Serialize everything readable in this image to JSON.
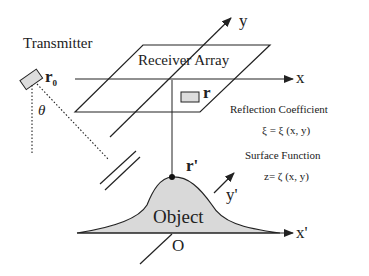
{
  "diagram": {
    "labels": {
      "transmitter": "Transmitter",
      "transmitter_position": "r",
      "transmitter_position_subscript": "0",
      "angle": "θ",
      "receiver_array": "Receiver  Array",
      "receiver_position": "r",
      "axis_x": "x",
      "axis_y": "y",
      "reflection_coefficient": "Reflection  Coefficient",
      "reflection_formula": "ξ = ξ (x, y)",
      "surface_function": "Surface  Function",
      "surface_formula": "z= ζ (x, y)",
      "surface_point": "r'",
      "axis_y_prime": "y'",
      "axis_x_prime": "x'",
      "object": "Object",
      "origin": "O"
    },
    "colors": {
      "line": "#222222",
      "fill": "#d9d9d9",
      "background": "#ffffff"
    }
  }
}
